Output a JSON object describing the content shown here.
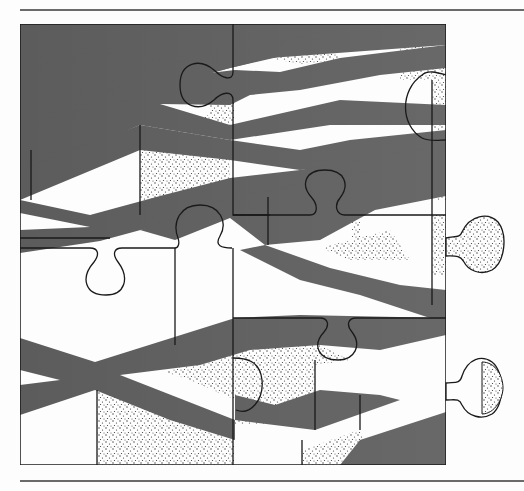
{
  "figure": {
    "colors": {
      "band": "#5c5c5c",
      "background": "#fdfdfd",
      "outline": "#1a1a1a",
      "stipple": "#333333",
      "rule": "#6a6a6a"
    },
    "pieces": [
      "top-left",
      "top-right",
      "middle-left",
      "middle-right",
      "bottom-left",
      "bottom-right"
    ],
    "loose_tabs": 2
  }
}
